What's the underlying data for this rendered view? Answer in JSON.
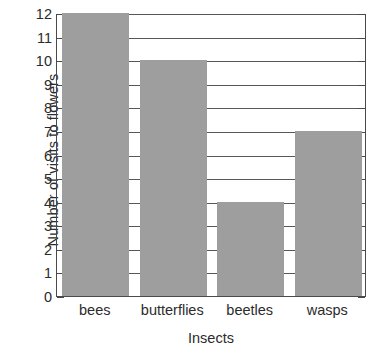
{
  "chart_data": {
    "type": "bar",
    "title": "",
    "xlabel": "Insects",
    "ylabel": "Number of visits to flowers",
    "categories": [
      "bees",
      "butterflies",
      "beetles",
      "wasps"
    ],
    "values": [
      12,
      10,
      4,
      7
    ],
    "ylim": [
      0,
      12
    ],
    "ytick_labels": [
      "0",
      "1",
      "2",
      "3",
      "4",
      "5",
      "6",
      "7",
      "8",
      "9",
      "10",
      "11",
      "12"
    ],
    "ytick_values": [
      0,
      1,
      2,
      3,
      4,
      5,
      6,
      7,
      8,
      9,
      10,
      11,
      12
    ],
    "grid": true,
    "grid_axis": "y",
    "legend": false,
    "bar_color": "#9e9e9e",
    "axis_color": "#4a4a4a",
    "gridline_color": "#585858",
    "background_color": "#ffffff"
  }
}
